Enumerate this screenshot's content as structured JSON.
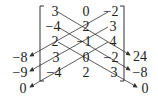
{
  "matrix": {
    "rows": [
      [
        "3",
        "0",
        "−2"
      ],
      [
        "−4",
        "2",
        "3"
      ],
      [
        "2",
        "−1",
        "4"
      ],
      [
        "3",
        "0",
        "−2"
      ],
      [
        "−4",
        "2",
        "3"
      ]
    ]
  },
  "left_products": [
    "−8",
    "−9",
    "0"
  ],
  "right_products": [
    "24",
    "−8",
    "0"
  ],
  "colors": {
    "ink": "#222222",
    "line": "#333333"
  }
}
